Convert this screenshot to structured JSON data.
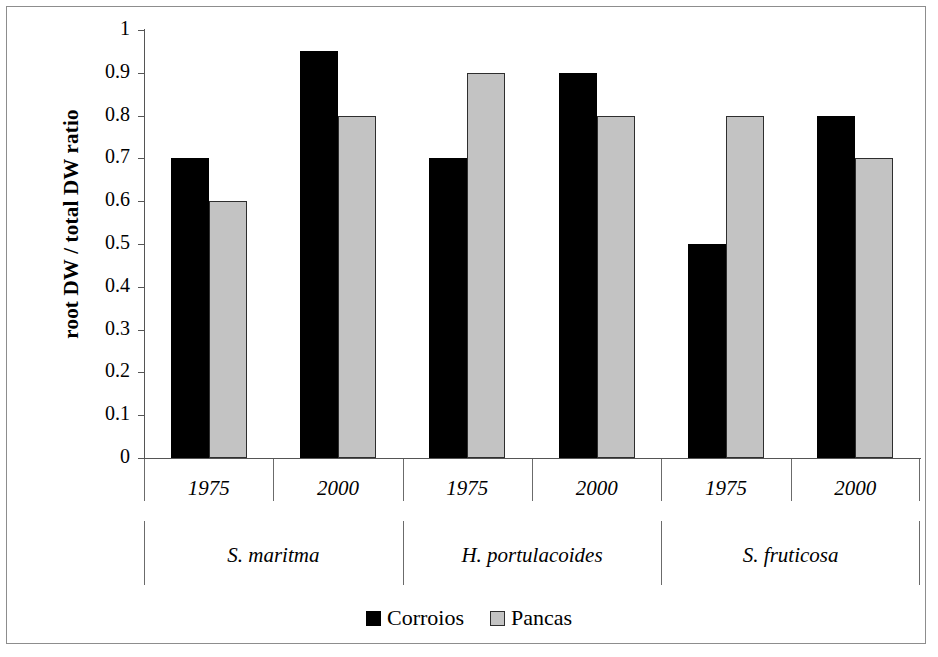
{
  "chart_data": {
    "type": "bar",
    "title": "",
    "subtitle": "",
    "xlabel": "",
    "ylabel": "root DW / total DW ratio",
    "ylim": [
      0,
      1
    ],
    "ytick_step": 0.1,
    "yticks": [
      "1",
      "0.9",
      "0.8",
      "0.7",
      "0.6",
      "0.5",
      "0.4",
      "0.3",
      "0.2",
      "0.1",
      "0"
    ],
    "ytick_values": [
      1,
      0.9,
      0.8,
      0.7,
      0.6,
      0.5,
      0.4,
      0.3,
      0.2,
      0.1,
      0
    ],
    "grid": false,
    "legend_position": "bottom-center",
    "groups": [
      "S. maritma",
      "H. portulacoides",
      "S. fruticosa"
    ],
    "categories": [
      "1975",
      "2000",
      "1975",
      "2000",
      "1975",
      "2000"
    ],
    "cells": [
      {
        "group": "S. maritma",
        "year": "1975",
        "corroios": 0.7,
        "pancas": 0.6
      },
      {
        "group": "S. maritma",
        "year": "2000",
        "corroios": 0.95,
        "pancas": 0.8
      },
      {
        "group": "H. portulacoides",
        "year": "1975",
        "corroios": 0.7,
        "pancas": 0.9
      },
      {
        "group": "H. portulacoides",
        "year": "2000",
        "corroios": 0.9,
        "pancas": 0.8
      },
      {
        "group": "S. fruticosa",
        "year": "1975",
        "corroios": 0.5,
        "pancas": 0.8
      },
      {
        "group": "S. fruticosa",
        "year": "2000",
        "corroios": 0.8,
        "pancas": 0.7
      }
    ],
    "series": [
      {
        "name": "Corroios",
        "color": "#000000",
        "values": [
          0.7,
          0.95,
          0.7,
          0.9,
          0.5,
          0.8
        ]
      },
      {
        "name": "Pancas",
        "color": "#c3c3c3",
        "values": [
          0.6,
          0.8,
          0.9,
          0.8,
          0.8,
          0.7
        ]
      }
    ]
  },
  "legend": {
    "entries": [
      {
        "label": "Corroios"
      },
      {
        "label": "Pancas"
      }
    ]
  }
}
